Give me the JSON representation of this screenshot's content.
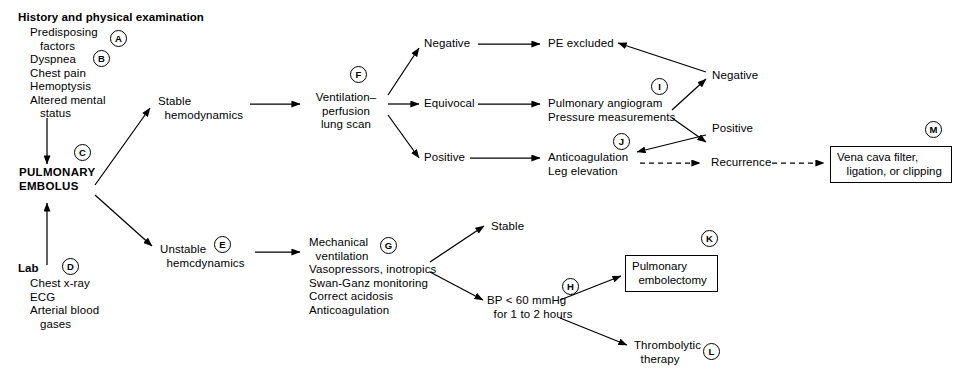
{
  "diagram": {
    "nodes": {
      "history_heading": "History and physical examination",
      "history_items": "Predisposing\n   factors\nDyspnea\nChest pain\nHemoptysis\nAltered mental\n   status",
      "pulmonary_embolus": "PULMONARY\nEMBOLUS",
      "lab_heading": "Lab",
      "lab_items": "Chest x-ray\nECG\nArterial blood\n   gases",
      "stable_hemodynamics": "Stable\n  hemodynamics",
      "unstable_hemodynamics": "Unstable\n  hemcdynamics",
      "vq_scan": "Ventilation–\nperfusion\nlung scan",
      "vq_negative": "Negative",
      "vq_equivocal": "Equivocal",
      "vq_positive": "Positive",
      "pe_excluded": "PE excluded",
      "angiogram": "Pulmonary angiogram\nPressure measurements",
      "angio_negative": "Negative",
      "angio_positive": "Positive",
      "anticoagulation": "Anticoagulation\nLeg elevation",
      "recurrence": "Recurrence",
      "vena_cava": "Vena cava filter,\n   ligation, or clipping",
      "supportive_care": "Mechanical\n  ventilation\nVasopressors, inotropics\nSwan-Ganz monitoring\nCorrect acidosis\nAnticoagulation",
      "stable_outcome": "Stable",
      "hypotension": "BP < 60 mmHg\n  for 1 to 2 hours",
      "embolectomy": "Pulmonary\n  embolectomy",
      "thrombolytic": "Thrombolytic\n  therapy"
    },
    "markers": {
      "a": "A",
      "b": "B",
      "c": "C",
      "d": "D",
      "e": "E",
      "f": "F",
      "g": "G",
      "h": "H",
      "i": "I",
      "j": "J",
      "k": "K",
      "l": "L",
      "m": "M"
    },
    "colors": {
      "ink": "#000000",
      "background": "#ffffff"
    }
  }
}
